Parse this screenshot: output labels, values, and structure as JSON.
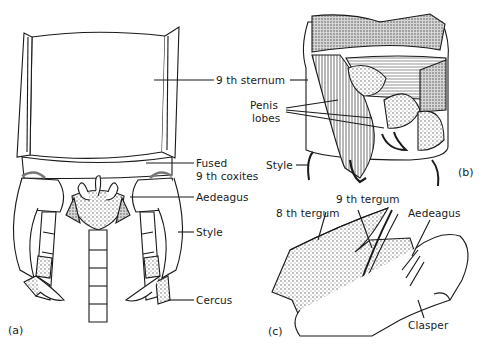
{
  "figure": {
    "panels": [
      {
        "id": "a",
        "marker": "(a)",
        "labels": {
          "sternum": "9 th sternum",
          "fused_line1": "Fused",
          "fused_line2": "9 th coxites",
          "aedeagus": "Aedeagus",
          "style": "Style",
          "cercus": "Cercus"
        }
      },
      {
        "id": "b",
        "marker": "(b)",
        "labels": {
          "penis_line1": "Penis",
          "penis_line2": "lobes",
          "style": "Style"
        }
      },
      {
        "id": "c",
        "marker": "(c)",
        "labels": {
          "tergum9": "9 th tergum",
          "tergum8": "8 th tergum",
          "aedeagus": "Aedeagus",
          "clasper": "Clasper"
        }
      }
    ],
    "colors": {
      "ink": "#1a1a1a",
      "stipple": "#b8b8b8",
      "background": "#ffffff"
    }
  }
}
